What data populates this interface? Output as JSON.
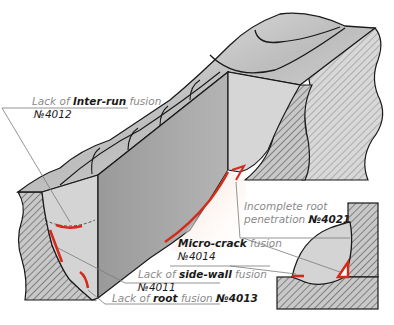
{
  "diagram": {
    "colors": {
      "defect": "#d42a1a",
      "metal_light": "#d0d0d0",
      "metal_dark": "#8c8c8c",
      "hatch": "#6e6e6e",
      "outline": "#1a1a1a",
      "label_gray": "#8a8a8a"
    },
    "labels": [
      {
        "id": "inter-run",
        "pre": "Lack of ",
        "key": "Inter-run",
        "post": " fusion",
        "code": "№4012"
      },
      {
        "id": "incomplete-root",
        "pre": "Incomplete root",
        "key": "",
        "post": "penetration ",
        "code": "№4021"
      },
      {
        "id": "micro-crack",
        "pre": "",
        "key": "Micro-crack",
        "post": " fusion",
        "code": "№4014"
      },
      {
        "id": "side-wall",
        "pre": "Lack of ",
        "key": "side-wall",
        "post": " fusion",
        "code": "№4011"
      },
      {
        "id": "root",
        "pre": "Lack of ",
        "key": "root",
        "post": " fusion ",
        "code": "№4013"
      }
    ]
  }
}
